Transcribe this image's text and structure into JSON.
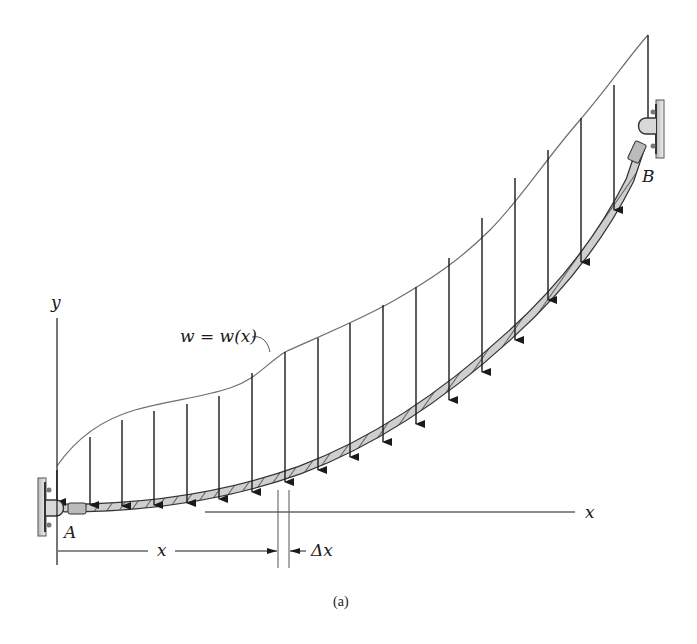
{
  "figure": {
    "caption": "(a)",
    "labels": {
      "y_axis": "y",
      "x_axis": "x",
      "load": "w = w(x)",
      "support_a": "A",
      "support_b": "B",
      "dim_x": "x",
      "dim_dx": "Δx"
    },
    "colors": {
      "line": "#1a1a1a",
      "load_curve": "#6e6e6e",
      "cable_fill": "#c8c8c8",
      "wall": "#9a9a9a"
    },
    "arrows_x": [
      57,
      90,
      122,
      154,
      187,
      219,
      252,
      285,
      318,
      350,
      383,
      416,
      449,
      482,
      515,
      548,
      581,
      614,
      648
    ]
  }
}
